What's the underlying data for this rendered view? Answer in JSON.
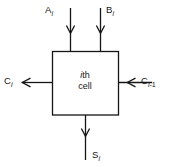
{
  "diagram": {
    "type": "block-diagram",
    "background_color": "#ffffff",
    "line_color": "#151515",
    "box": {
      "label_line1_italic": "i",
      "label_line1_rest": "th",
      "label_line2": "cell",
      "x": 52,
      "y": 51,
      "width": 66,
      "height": 64
    },
    "signals": [
      {
        "name": "input-a",
        "base": "A",
        "subscript": "i",
        "direction": "down",
        "edge": "top",
        "label_text": "A_i"
      },
      {
        "name": "input-b",
        "base": "B",
        "subscript": "i",
        "direction": "down",
        "edge": "top",
        "label_text": "B_i"
      },
      {
        "name": "carry-out",
        "base": "C",
        "subscript": "i",
        "direction": "left",
        "edge": "left",
        "label_text": "C_i"
      },
      {
        "name": "carry-in",
        "base": "C",
        "subscript": "i-1",
        "direction": "left",
        "edge": "right",
        "label_text": "C_i-1"
      },
      {
        "name": "sum-out",
        "base": "S",
        "subscript": "i",
        "direction": "down",
        "edge": "bottom",
        "label_text": "S_i"
      }
    ]
  }
}
